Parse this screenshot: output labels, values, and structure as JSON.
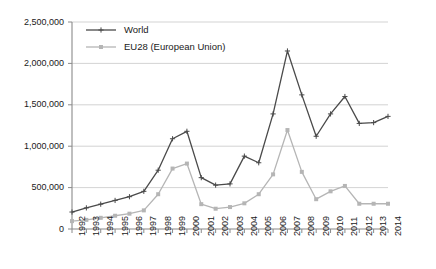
{
  "chart_data": {
    "type": "line",
    "title": "",
    "subtitle": "",
    "xlabel": "",
    "ylabel": "",
    "categories": [
      "1992",
      "1993",
      "1994",
      "1995",
      "1996",
      "1997",
      "1998",
      "1999",
      "2000",
      "2001",
      "2002",
      "2003",
      "2004",
      "2005",
      "2006",
      "2007",
      "2008",
      "2009",
      "2010",
      "2011",
      "2012",
      "2013",
      "2014"
    ],
    "x": [
      1992,
      1993,
      1994,
      1995,
      1996,
      1997,
      1998,
      1999,
      2000,
      2001,
      2002,
      2003,
      2004,
      2005,
      2006,
      2007,
      2008,
      2009,
      2010,
      2011,
      2012,
      2013,
      2014
    ],
    "series": [
      {
        "name": "World",
        "color": "#4a4a4a",
        "marker": "plus",
        "values": [
          205000,
          255000,
          300000,
          345000,
          390000,
          455000,
          710000,
          1090000,
          1180000,
          620000,
          530000,
          545000,
          880000,
          800000,
          1390000,
          2150000,
          1620000,
          1120000,
          1390000,
          1600000,
          1275000,
          1285000,
          1360000
        ]
      },
      {
        "name": "EU28 (European Union)",
        "color": "#b5b5b5",
        "marker": "square",
        "values": [
          95000,
          110000,
          135000,
          160000,
          185000,
          225000,
          420000,
          730000,
          790000,
          300000,
          245000,
          265000,
          310000,
          420000,
          660000,
          1195000,
          690000,
          360000,
          455000,
          520000,
          305000,
          305000,
          305000
        ]
      }
    ],
    "ylim": [
      0,
      2500000
    ],
    "yticks": [
      0,
      500000,
      1000000,
      1500000,
      2000000,
      2500000
    ],
    "ytick_labels": [
      "0",
      "500,000",
      "1,000,000",
      "1,500,000",
      "2,000,000",
      "2,500,000"
    ],
    "grid": true,
    "grid_axis": "y",
    "legend_position": "top-left",
    "legend": [
      "World",
      "EU28 (European Union)"
    ]
  },
  "style": {
    "grid_color": "#c8c8c8",
    "axis_color": "#8a8a8a",
    "text_color": "#1a1a1a",
    "background": "#ffffff"
  }
}
